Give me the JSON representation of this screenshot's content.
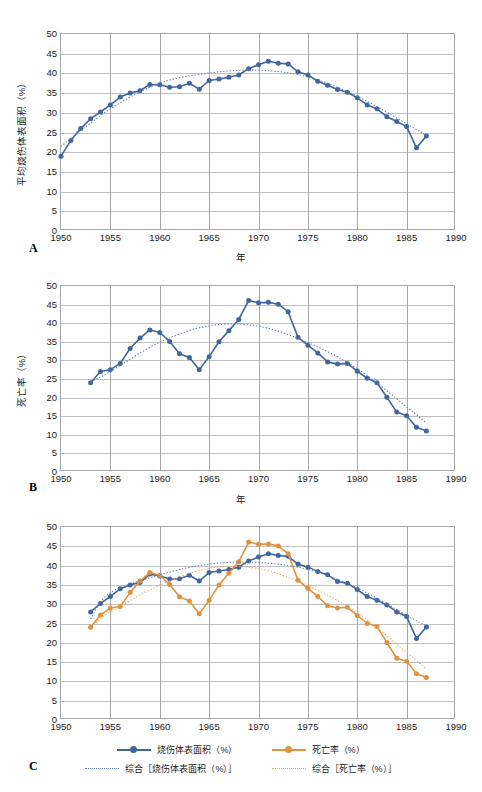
{
  "figure": {
    "panels": [
      "A",
      "B",
      "C"
    ],
    "colors": {
      "series_burn_area": "#41659E",
      "series_mortality": "#E2913F",
      "trend_burn_area": "#5B7FB5",
      "trend_mortality": "#E8A96B",
      "axis": "#A6A6A6",
      "grid": "#BFBFBF",
      "text": "#1A1A1A"
    }
  },
  "panel_a": {
    "letter": "A",
    "xlabel": "年",
    "ylabel": "平均烧伤体表面积（%）",
    "yticks": [
      "0",
      "5",
      "10",
      "15",
      "20",
      "25",
      "30",
      "35",
      "40",
      "45",
      "50"
    ],
    "xticks": [
      "1950",
      "1955",
      "1960",
      "1965",
      "1970",
      "1975",
      "1980",
      "1985",
      "1990"
    ]
  },
  "panel_b": {
    "letter": "B",
    "xlabel": "年",
    "ylabel": "死亡率（%）",
    "yticks": [
      "0",
      "5",
      "10",
      "15",
      "20",
      "25",
      "30",
      "35",
      "40",
      "45",
      "50"
    ],
    "xticks": [
      "1950",
      "1955",
      "1960",
      "1965",
      "1970",
      "1975",
      "1980",
      "1985",
      "1990"
    ]
  },
  "panel_c": {
    "letter": "C",
    "xlabel": "",
    "ylabel": "",
    "yticks": [
      "0",
      "5",
      "10",
      "15",
      "20",
      "25",
      "30",
      "35",
      "40",
      "45",
      "50"
    ],
    "xticks": [
      "1950",
      "1955",
      "1960",
      "1965",
      "1970",
      "1975",
      "1980",
      "1985",
      "1990"
    ],
    "legend": [
      {
        "label": "烧伤体表面积（%）",
        "style": "solid-marker",
        "color": "#41659E"
      },
      {
        "label": "死亡率（%）",
        "style": "solid-marker",
        "color": "#E2913F"
      },
      {
        "label": "综合［烧伤体表面积（%）］",
        "style": "dotted",
        "color": "#5B7FB5"
      },
      {
        "label": "综合［死亡率（%）］",
        "style": "dotted",
        "color": "#E8A96B"
      }
    ]
  },
  "chart_data": [
    {
      "panel": "A",
      "type": "line",
      "title": "",
      "xlabel": "年",
      "ylabel": "平均烧伤体表面积（%）",
      "xlim": [
        1950,
        1990
      ],
      "ylim": [
        0,
        50
      ],
      "grid": true,
      "legend": "none",
      "series": [
        {
          "name": "平均烧伤体表面积（%）",
          "color": "#41659E",
          "marker": "circle",
          "x": [
            1950,
            1951,
            1952,
            1953,
            1954,
            1955,
            1956,
            1957,
            1958,
            1959,
            1960,
            1961,
            1962,
            1963,
            1964,
            1965,
            1966,
            1967,
            1968,
            1969,
            1970,
            1971,
            1972,
            1973,
            1974,
            1975,
            1976,
            1977,
            1978,
            1979,
            1980,
            1981,
            1982,
            1983,
            1984,
            1985,
            1986,
            1987
          ],
          "values": [
            19.0,
            23.0,
            26.0,
            28.5,
            30.2,
            32.0,
            34.0,
            35.0,
            35.6,
            37.2,
            37.1,
            36.5,
            36.6,
            37.5,
            36.0,
            38.2,
            38.6,
            39.0,
            39.6,
            41.2,
            42.2,
            43.1,
            42.6,
            42.4,
            40.4,
            39.6,
            38.0,
            37.0,
            35.9,
            35.2,
            33.8,
            32.0,
            31.0,
            29.0,
            27.8,
            26.5,
            21.1,
            24.1
          ]
        },
        {
          "name": "综合［烧伤体表面积（%）］",
          "color": "#5B7FB5",
          "style": "dotted",
          "x": [
            1950,
            1955,
            1960,
            1965,
            1970,
            1975,
            1980,
            1985,
            1987
          ],
          "values": [
            21.5,
            31.0,
            37.5,
            40.1,
            40.8,
            39.1,
            34.2,
            27.2,
            24.2
          ]
        }
      ]
    },
    {
      "panel": "B",
      "type": "line",
      "title": "",
      "xlabel": "年",
      "ylabel": "死亡率（%）",
      "xlim": [
        1950,
        1990
      ],
      "ylim": [
        0,
        50
      ],
      "grid": true,
      "legend": "none",
      "series": [
        {
          "name": "死亡率（%）",
          "color": "#41659E",
          "marker": "circle",
          "x": [
            1953,
            1954,
            1955,
            1956,
            1957,
            1958,
            1959,
            1960,
            1961,
            1962,
            1963,
            1964,
            1965,
            1966,
            1967,
            1968,
            1969,
            1970,
            1971,
            1972,
            1973,
            1974,
            1975,
            1976,
            1977,
            1978,
            1979,
            1980,
            1981,
            1982,
            1983,
            1984,
            1985,
            1986,
            1987
          ],
          "values": [
            24.0,
            27.0,
            27.5,
            29.2,
            33.2,
            36.0,
            38.2,
            37.5,
            35.1,
            31.8,
            30.8,
            27.5,
            31.0,
            35.0,
            38.0,
            41.0,
            46.1,
            45.5,
            45.6,
            45.1,
            43.1,
            36.2,
            34.1,
            32.0,
            29.6,
            29.0,
            29.2,
            27.1,
            25.2,
            24.0,
            20.1,
            16.1,
            15.1,
            12.0,
            11.0
          ]
        },
        {
          "name": "综合［死亡率（%）］",
          "color": "#5B7FB5",
          "style": "dotted",
          "x": [
            1953,
            1955,
            1960,
            1965,
            1970,
            1975,
            1980,
            1985,
            1987
          ],
          "values": [
            24.2,
            27.0,
            34.9,
            39.3,
            39.2,
            34.8,
            27.8,
            17.5,
            13.2
          ]
        }
      ]
    },
    {
      "panel": "C",
      "type": "line",
      "title": "",
      "xlabel": "",
      "ylabel": "",
      "xlim": [
        1950,
        1990
      ],
      "ylim": [
        0,
        50
      ],
      "grid": true,
      "legend": "bottom",
      "series": [
        {
          "name": "烧伤体表面积（%）",
          "color": "#41659E",
          "marker": "circle",
          "x": [
            1953,
            1954,
            1955,
            1956,
            1957,
            1958,
            1959,
            1960,
            1961,
            1962,
            1963,
            1964,
            1965,
            1966,
            1967,
            1968,
            1969,
            1970,
            1971,
            1972,
            1973,
            1974,
            1975,
            1976,
            1977,
            1978,
            1979,
            1980,
            1981,
            1982,
            1983,
            1984,
            1985,
            1986,
            1987
          ],
          "values": [
            28.0,
            30.2,
            32.0,
            34.0,
            35.0,
            35.6,
            37.8,
            37.3,
            36.5,
            36.6,
            37.5,
            36.0,
            38.2,
            38.6,
            39.0,
            39.6,
            41.2,
            42.2,
            43.1,
            42.6,
            42.4,
            40.4,
            39.6,
            38.5,
            37.6,
            35.9,
            35.4,
            33.8,
            32.0,
            31.0,
            29.8,
            28.0,
            26.8,
            21.1,
            24.1
          ]
        },
        {
          "name": "死亡率（%）",
          "color": "#E2913F",
          "marker": "circle",
          "x": [
            1953,
            1954,
            1955,
            1956,
            1957,
            1958,
            1959,
            1960,
            1961,
            1962,
            1963,
            1964,
            1965,
            1966,
            1967,
            1968,
            1969,
            1970,
            1971,
            1972,
            1973,
            1974,
            1975,
            1976,
            1977,
            1978,
            1979,
            1980,
            1981,
            1982,
            1983,
            1984,
            1985,
            1986,
            1987
          ],
          "values": [
            24.0,
            27.2,
            29.0,
            29.4,
            33.0,
            36.0,
            38.2,
            37.5,
            35.1,
            31.9,
            30.8,
            27.5,
            31.0,
            35.0,
            38.0,
            41.0,
            46.1,
            45.5,
            45.6,
            45.1,
            43.1,
            36.2,
            34.1,
            32.0,
            29.6,
            29.0,
            29.2,
            27.1,
            25.0,
            24.2,
            20.1,
            16.0,
            15.2,
            12.0,
            11.0
          ]
        },
        {
          "name": "综合［烧伤体表面积（%）］",
          "color": "#5B7FB5",
          "style": "dotted",
          "x": [
            1953,
            1955,
            1960,
            1965,
            1970,
            1975,
            1980,
            1985,
            1987
          ],
          "values": [
            26.2,
            33.0,
            37.6,
            40.4,
            40.8,
            39.0,
            34.2,
            27.1,
            24.3
          ]
        },
        {
          "name": "综合［死亡率（%）］",
          "color": "#E8A96B",
          "style": "dotted",
          "x": [
            1953,
            1955,
            1960,
            1965,
            1970,
            1975,
            1980,
            1985,
            1987
          ],
          "values": [
            24.2,
            28.0,
            34.9,
            39.3,
            39.2,
            34.8,
            27.8,
            17.5,
            13.2
          ]
        }
      ]
    }
  ]
}
